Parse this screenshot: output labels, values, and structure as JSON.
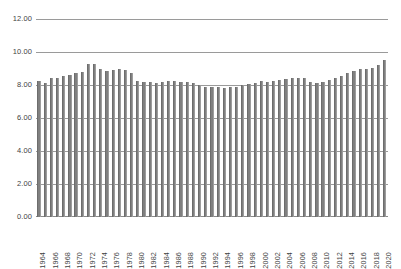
{
  "chart_data": {
    "type": "bar",
    "title": "",
    "subtitle": "",
    "xlabel": "",
    "ylabel": "",
    "ylim": [
      0,
      12
    ],
    "ytick_step": 2,
    "ytick_labels": [
      "12.00",
      "10.00",
      "8.00",
      "6.00",
      "4.00",
      "2.00",
      "0.00"
    ],
    "ytick_values": [
      12,
      10,
      8,
      6,
      4,
      2,
      0
    ],
    "grid": true,
    "legend": false,
    "legend_position": "none",
    "xtick_interval": 2,
    "bar_color": "#808080",
    "gridline_color": "#9a9a9a",
    "categories": [
      "1964",
      "1965",
      "1966",
      "1967",
      "1968",
      "1969",
      "1970",
      "1971",
      "1972",
      "1973",
      "1974",
      "1975",
      "1976",
      "1977",
      "1978",
      "1979",
      "1980",
      "1981",
      "1982",
      "1983",
      "1984",
      "1985",
      "1986",
      "1987",
      "1988",
      "1989",
      "1990",
      "1991",
      "1992",
      "1993",
      "1994",
      "1995",
      "1996",
      "1997",
      "1998",
      "1999",
      "2000",
      "2001",
      "2002",
      "2003",
      "2004",
      "2005",
      "2006",
      "2007",
      "2008",
      "2009",
      "2010",
      "2011",
      "2012",
      "2013",
      "2014",
      "2015",
      "2016",
      "2017",
      "2018",
      "2019",
      "2020"
    ],
    "values": [
      8.25,
      8.15,
      8.4,
      8.45,
      8.55,
      8.6,
      8.75,
      8.8,
      9.3,
      9.25,
      8.95,
      8.85,
      8.9,
      8.95,
      8.9,
      8.7,
      8.25,
      8.2,
      8.2,
      8.15,
      8.2,
      8.25,
      8.25,
      8.2,
      8.2,
      8.15,
      8.0,
      7.9,
      7.85,
      7.85,
      7.8,
      7.85,
      7.9,
      8.0,
      8.05,
      8.15,
      8.25,
      8.2,
      8.25,
      8.3,
      8.35,
      8.4,
      8.45,
      8.4,
      8.2,
      8.15,
      8.2,
      8.3,
      8.45,
      8.55,
      8.7,
      8.85,
      9.0,
      8.95,
      9.05,
      9.2,
      9.5
    ]
  }
}
